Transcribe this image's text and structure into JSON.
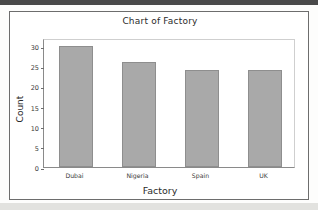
{
  "chart_data": {
    "type": "bar",
    "title": "Chart of Factory",
    "xlabel": "Factory",
    "ylabel": "Count",
    "categories": [
      "Dubai",
      "Nigeria",
      "Spain",
      "UK"
    ],
    "values": [
      30,
      26,
      24,
      24
    ],
    "ylim": [
      0,
      32
    ],
    "yticks": [
      0,
      5,
      10,
      15,
      20,
      25,
      30
    ],
    "ytick_labels": [
      "0",
      "5",
      "10",
      "15",
      "20",
      "25",
      "30"
    ],
    "grid": false,
    "legend": false,
    "bar_color": "#a9a9a9",
    "bar_edge_color": "#8e8e8e",
    "plot_border_color": "#8a8a8a",
    "frame_color": "#6d6d6d",
    "text_color": "#2b2b2b",
    "background": "#ffffff"
  }
}
